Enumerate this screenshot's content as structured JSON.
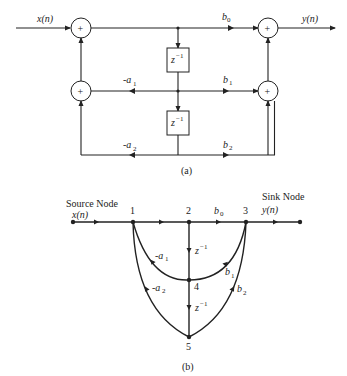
{
  "diagram_a": {
    "caption": "(a)",
    "input_label": "x(n)",
    "output_label": "y(n)",
    "adder_symbol": "+",
    "delay_label": "z",
    "delay_exp": "−1",
    "gains": {
      "b0": {
        "base": "b",
        "sub": "0"
      },
      "b1": {
        "base": "b",
        "sub": "1"
      },
      "b2": {
        "base": "b",
        "sub": "2"
      },
      "a1": {
        "base": "-a",
        "sub": "1"
      },
      "a2": {
        "base": "-a",
        "sub": "2"
      }
    }
  },
  "diagram_b": {
    "caption": "(b)",
    "source_label": "Source Node",
    "source_signal": "x(n)",
    "sink_label": "Sink Node",
    "sink_signal": "y(n)",
    "nodes": [
      "1",
      "2",
      "3",
      "4",
      "5"
    ],
    "delay_label": "z",
    "delay_exp": "−1",
    "gains": {
      "b0": {
        "base": "b",
        "sub": "0"
      },
      "b1": {
        "base": "b",
        "sub": "1"
      },
      "b2": {
        "base": "b",
        "sub": "2"
      },
      "a1": {
        "base": "-a",
        "sub": "1"
      },
      "a2": {
        "base": "-a",
        "sub": "2"
      }
    }
  }
}
